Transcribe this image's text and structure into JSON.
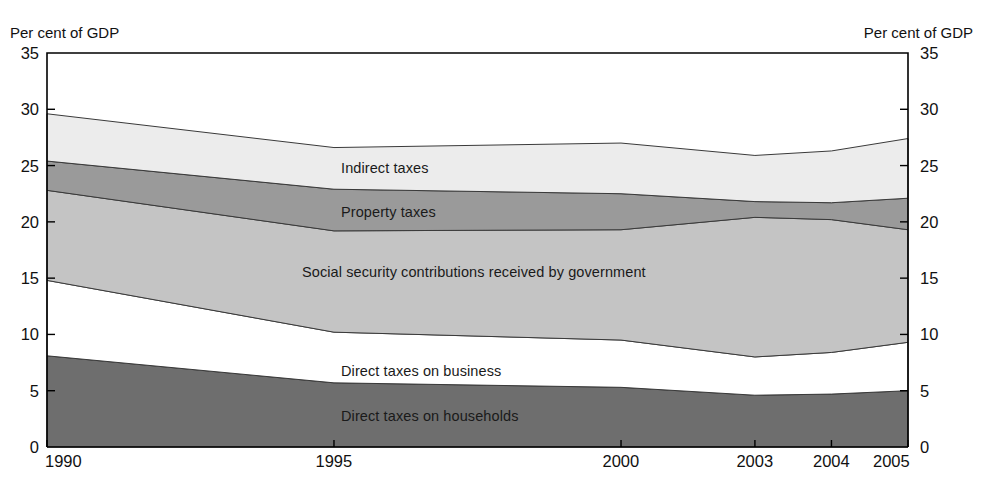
{
  "axis": {
    "left_caption": "Per cent of GDP",
    "right_caption": "Per cent of GDP",
    "y_ticks": [
      "35",
      "30",
      "25",
      "20",
      "15",
      "10",
      "5",
      "0"
    ],
    "x_ticks": [
      "1990",
      "1995",
      "2000",
      "2003",
      "2004",
      "2005"
    ]
  },
  "series_labels": {
    "indirect": "Indirect taxes",
    "property": "Property taxes",
    "social": "Social security contributions received by government",
    "business": "Direct taxes on business",
    "households": "Direct taxes on households"
  },
  "colors": {
    "indirect": "#ececec",
    "property": "#9a9a9a",
    "social": "#c4c4c4",
    "business": "#ffffff",
    "households": "#6e6e6e",
    "stroke": "#3a3a3a",
    "frame": "#000000"
  },
  "chart_data": {
    "type": "area",
    "title": "",
    "xlabel": "",
    "ylabel": "Per cent of GDP",
    "ylim": [
      0,
      35
    ],
    "ytick_step": 5,
    "grid": false,
    "legend": "inline-band-labels",
    "stacked": true,
    "x": [
      "1990",
      "1995",
      "2000",
      "2003",
      "2004",
      "2005"
    ],
    "x_positions": [
      0,
      0.3333,
      0.6667,
      0.8222,
      0.9111,
      1.0
    ],
    "series": [
      {
        "name": "Direct taxes on households",
        "values": [
          8.1,
          5.7,
          5.3,
          4.6,
          4.7,
          5.0
        ]
      },
      {
        "name": "Direct taxes on business",
        "values": [
          6.7,
          4.5,
          4.2,
          3.4,
          3.7,
          4.3
        ]
      },
      {
        "name": "Social security contributions received by government",
        "values": [
          8.0,
          9.0,
          9.8,
          12.4,
          11.8,
          10.0
        ]
      },
      {
        "name": "Property taxes",
        "values": [
          2.6,
          3.7,
          3.2,
          1.4,
          1.5,
          2.8
        ]
      },
      {
        "name": "Indirect taxes",
        "values": [
          4.2,
          3.7,
          4.5,
          4.1,
          4.6,
          5.3
        ]
      }
    ],
    "cumulative_tops": {
      "households": [
        8.1,
        5.7,
        5.3,
        4.6,
        4.7,
        5.0
      ],
      "business": [
        14.8,
        10.2,
        9.5,
        8.0,
        8.4,
        9.3
      ],
      "social": [
        22.8,
        19.2,
        19.3,
        20.4,
        20.2,
        19.3
      ],
      "property": [
        25.4,
        22.9,
        22.5,
        21.8,
        21.7,
        22.1
      ],
      "indirect": [
        29.6,
        26.6,
        27.0,
        25.9,
        26.3,
        27.4
      ]
    }
  },
  "geometry": {
    "plot_left": 47,
    "plot_right": 908,
    "plot_top": 53,
    "plot_bottom": 447
  }
}
